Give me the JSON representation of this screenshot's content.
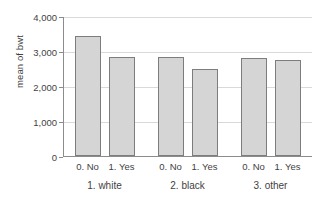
{
  "chart_data": {
    "type": "bar",
    "title": "",
    "subtitle": "",
    "xlabel": "",
    "ylabel": "mean of bwt",
    "ylim": [
      0,
      4000
    ],
    "grid": true,
    "legend": false,
    "legend_position": "none",
    "y_ticks": [
      {
        "value": 4000,
        "label": "4,000"
      },
      {
        "value": 3000,
        "label": "3,000"
      },
      {
        "value": 2000,
        "label": "2,000"
      },
      {
        "value": 1000,
        "label": "1,000"
      },
      {
        "value": 0,
        "label": "0"
      }
    ],
    "groups": [
      {
        "label": "1. white",
        "bars": [
          {
            "label": "0. No",
            "value": 3440
          },
          {
            "label": "1. Yes",
            "value": 2820
          }
        ]
      },
      {
        "label": "2. black",
        "bars": [
          {
            "label": "0. No",
            "value": 2840
          },
          {
            "label": "1. Yes",
            "value": 2500
          }
        ]
      },
      {
        "label": "3. other",
        "bars": [
          {
            "label": "0. No",
            "value": 2800
          },
          {
            "label": "1. Yes",
            "value": 2740
          }
        ]
      }
    ],
    "categories": [
      "1. white / 0. No",
      "1. white / 1. Yes",
      "2. black / 0. No",
      "2. black / 1. Yes",
      "3. other / 0. No",
      "3. other / 1. Yes"
    ],
    "values": [
      3440,
      2820,
      2840,
      2500,
      2800,
      2740
    ],
    "bar_fill_color": "#d5d5d5",
    "bar_border_color": "#7d7d7d",
    "grid_color": "#d9d9d9",
    "axis_color": "#8c8c8c",
    "text_color": "#3f3f3f"
  }
}
